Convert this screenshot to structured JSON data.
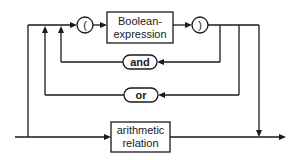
{
  "diagram": {
    "type": "syntax-railroad",
    "nodes": {
      "open_paren": {
        "label": "("
      },
      "boolean_expression": {
        "line1": "Boolean-",
        "line2": "expression"
      },
      "close_paren": {
        "label": ")"
      },
      "and_keyword": {
        "label": "and"
      },
      "or_keyword": {
        "label": "or"
      },
      "arithmetic_relation": {
        "line1": "arithmetic",
        "line2": "relation"
      }
    },
    "colors": {
      "line": "#1a1a1a",
      "background": "#ffffff"
    }
  }
}
